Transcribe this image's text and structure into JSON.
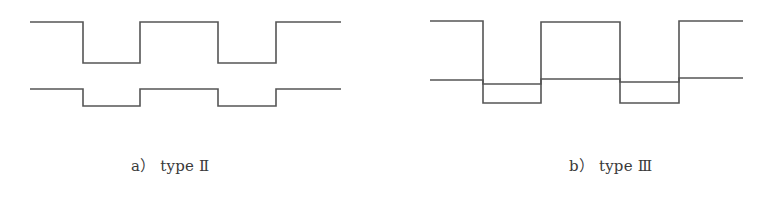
{
  "figure": {
    "stroke_color": "#555555",
    "panels": [
      {
        "id": "a",
        "caption": "a） type Ⅱ",
        "waveforms": [
          {
            "name": "upper-waveform",
            "points": [
              [
                30,
                22
              ],
              [
                83,
                22
              ],
              [
                83,
                63
              ],
              [
                140,
                63
              ],
              [
                140,
                22
              ],
              [
                218,
                22
              ],
              [
                218,
                63
              ],
              [
                276,
                63
              ],
              [
                276,
                22
              ],
              [
                341,
                22
              ]
            ]
          },
          {
            "name": "lower-waveform",
            "points": [
              [
                30,
                89
              ],
              [
                83,
                89
              ],
              [
                83,
                106
              ],
              [
                140,
                106
              ],
              [
                140,
                89
              ],
              [
                218,
                89
              ],
              [
                218,
                106
              ],
              [
                276,
                106
              ],
              [
                276,
                89
              ],
              [
                341,
                89
              ]
            ]
          }
        ]
      },
      {
        "id": "b",
        "caption": "b） type Ⅲ",
        "waveforms": [
          {
            "name": "large-waveform",
            "points": [
              [
                430,
                21
              ],
              [
                483,
                21
              ],
              [
                483,
                103
              ],
              [
                541,
                103
              ],
              [
                541,
                22
              ],
              [
                620,
                22
              ],
              [
                620,
                103
              ],
              [
                679,
                103
              ],
              [
                679,
                21
              ],
              [
                743,
                21
              ]
            ]
          },
          {
            "name": "small-waveform",
            "points": [
              [
                430,
                80
              ],
              [
                483,
                80
              ],
              [
                483,
                84
              ],
              [
                541,
                84
              ],
              [
                541,
                79
              ],
              [
                620,
                79
              ],
              [
                620,
                82
              ],
              [
                679,
                82
              ],
              [
                679,
                78
              ],
              [
                743,
                78
              ]
            ]
          }
        ]
      }
    ]
  }
}
